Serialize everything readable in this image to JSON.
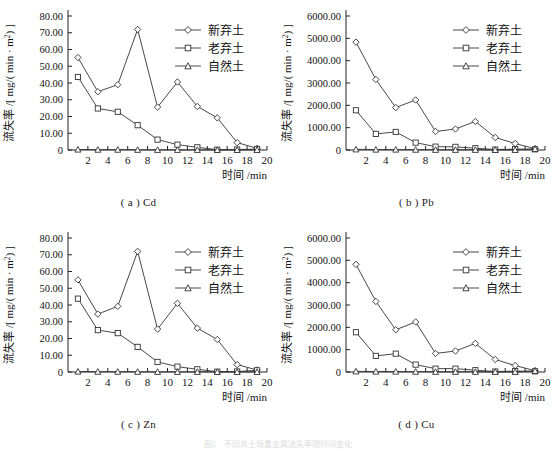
{
  "figure": {
    "note": "图2　不同弃土场重金属流失率随时间变化",
    "axis": {
      "xlabel": "时间 /min",
      "ylabel": "流失率 /[ mg/( min · m2) ]",
      "ylabel_parts": {
        "prefix": "流失率 /[ mg/( min · m",
        "sup": "2",
        "suffix": ") ]"
      },
      "xticks": [
        2,
        4,
        6,
        8,
        10,
        12,
        14,
        16,
        18,
        20
      ],
      "xlim": [
        0,
        20
      ]
    },
    "legend": [
      {
        "label": "新弃土",
        "marker": "diamond"
      },
      {
        "label": "老弃土",
        "marker": "square"
      },
      {
        "label": "自然土",
        "marker": "triangle"
      }
    ]
  },
  "chart_data": [
    {
      "id": "a",
      "type": "line",
      "title": "( a ) Cd",
      "xlabel": "时间 /min",
      "ylabel": "流失率 /[ mg/( min · m2) ]",
      "xlim": [
        0,
        20
      ],
      "ylim": [
        0,
        80
      ],
      "yticks": [
        0,
        10,
        20,
        30,
        40,
        50,
        60,
        70,
        80
      ],
      "ytick_labels": [
        "0",
        "10.00",
        "20.00",
        "30.00",
        "40.00",
        "50.00",
        "60.00",
        "70.00",
        "80.00"
      ],
      "xticks": [
        2,
        4,
        6,
        8,
        10,
        12,
        14,
        16,
        18,
        20
      ],
      "grid": false,
      "legend_position": "top-right",
      "x": [
        1,
        3,
        5,
        7,
        9,
        11,
        13,
        15,
        17,
        19
      ],
      "series": [
        {
          "name": "新弃土",
          "marker": "diamond",
          "values": [
            55.2,
            34.8,
            39.0,
            72.0,
            25.6,
            40.6,
            26.0,
            19.2,
            4.4,
            1.0
          ]
        },
        {
          "name": "老弃土",
          "marker": "square",
          "values": [
            43.6,
            24.8,
            22.8,
            14.8,
            6.2,
            3.2,
            1.6,
            0.2,
            0.3,
            0.5
          ]
        },
        {
          "name": "自然土",
          "marker": "triangle",
          "values": [
            0.3,
            0.2,
            0.2,
            0.15,
            0.1,
            0.1,
            0.1,
            0.05,
            0.05,
            0.05
          ]
        }
      ]
    },
    {
      "id": "b",
      "type": "line",
      "title": "( b ) Pb",
      "xlabel": "时间 /min",
      "ylabel": "流失率 /[ mg/( min · m2) ]",
      "xlim": [
        0,
        20
      ],
      "ylim": [
        0,
        6000
      ],
      "yticks": [
        0,
        1000,
        2000,
        3000,
        4000,
        5000,
        6000
      ],
      "ytick_labels": [
        "0",
        "1000.00",
        "2000.00",
        "3000.00",
        "4000.00",
        "5000.00",
        "6000.00"
      ],
      "xticks": [
        2,
        4,
        6,
        8,
        10,
        12,
        14,
        16,
        18,
        20
      ],
      "grid": false,
      "legend_position": "top-right",
      "x": [
        1,
        3,
        5,
        7,
        9,
        11,
        13,
        15,
        17,
        19
      ],
      "series": [
        {
          "name": "新弃土",
          "marker": "diamond",
          "values": [
            4830,
            3160,
            1900,
            2240,
            830,
            940,
            1280,
            560,
            290,
            60
          ]
        },
        {
          "name": "老弃土",
          "marker": "square",
          "values": [
            1780,
            720,
            810,
            330,
            150,
            140,
            80,
            20,
            40,
            30
          ]
        },
        {
          "name": "自然土",
          "marker": "triangle",
          "values": [
            30,
            20,
            20,
            15,
            10,
            10,
            10,
            5,
            5,
            50
          ]
        }
      ]
    },
    {
      "id": "c",
      "type": "line",
      "title": "( c ) Zn",
      "xlabel": "时间 /min",
      "ylabel": "流失率 /[ mg/( min · m2) ]",
      "xlim": [
        0,
        20
      ],
      "ylim": [
        0,
        80
      ],
      "yticks": [
        0,
        10,
        20,
        30,
        40,
        50,
        60,
        70,
        80
      ],
      "ytick_labels": [
        "0",
        "10.00",
        "20.00",
        "30.00",
        "40.00",
        "50.00",
        "60.00",
        "70.00",
        "80.00"
      ],
      "xticks": [
        2,
        4,
        6,
        8,
        10,
        12,
        14,
        16,
        18,
        20
      ],
      "grid": false,
      "legend_position": "top-right",
      "x": [
        1,
        3,
        5,
        7,
        9,
        11,
        13,
        15,
        17,
        19
      ],
      "series": [
        {
          "name": "新弃土",
          "marker": "diamond",
          "values": [
            55.0,
            34.6,
            39.2,
            72.0,
            25.6,
            41.0,
            26.2,
            19.4,
            4.4,
            1.2
          ]
        },
        {
          "name": "老弃土",
          "marker": "square",
          "values": [
            43.8,
            25.0,
            23.2,
            15.0,
            6.0,
            3.2,
            1.6,
            0.2,
            0.3,
            1.0
          ]
        },
        {
          "name": "自然土",
          "marker": "triangle",
          "values": [
            0.3,
            0.2,
            0.2,
            0.15,
            0.1,
            0.1,
            0.1,
            0.05,
            0.05,
            0.05
          ]
        }
      ]
    },
    {
      "id": "d",
      "type": "line",
      "title": "( d ) Cu",
      "xlabel": "时间 /min",
      "ylabel": "流失率 /[ mg/( min · m2) ]",
      "xlim": [
        0,
        20
      ],
      "ylim": [
        0,
        6000
      ],
      "yticks": [
        0,
        1000,
        2000,
        3000,
        4000,
        5000,
        6000
      ],
      "ytick_labels": [
        "0",
        "1000.00",
        "2000.00",
        "3000.00",
        "4000.00",
        "5000.00",
        "6000.00"
      ],
      "xticks": [
        2,
        4,
        6,
        8,
        10,
        12,
        14,
        16,
        18,
        20
      ],
      "grid": false,
      "legend_position": "top-right",
      "x": [
        1,
        3,
        5,
        7,
        9,
        11,
        13,
        15,
        17,
        19
      ],
      "series": [
        {
          "name": "新弃土",
          "marker": "diamond",
          "values": [
            4820,
            3160,
            1890,
            2240,
            830,
            940,
            1280,
            560,
            290,
            60
          ]
        },
        {
          "name": "老弃土",
          "marker": "square",
          "values": [
            1780,
            720,
            820,
            330,
            150,
            150,
            80,
            20,
            40,
            30
          ]
        },
        {
          "name": "自然土",
          "marker": "triangle",
          "values": [
            30,
            20,
            20,
            15,
            10,
            10,
            10,
            5,
            5,
            50
          ]
        }
      ]
    }
  ]
}
